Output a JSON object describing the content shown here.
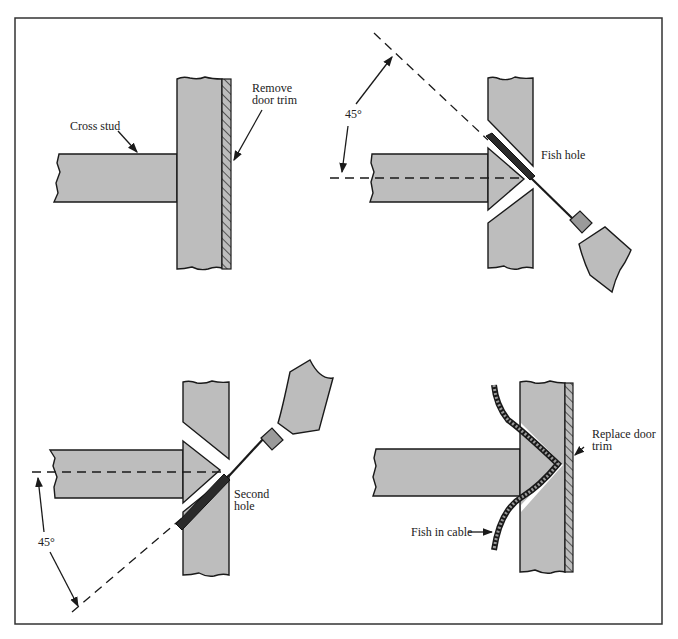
{
  "figure": {
    "colors": {
      "wood": "#bdbdbd",
      "line": "#1a1a1a",
      "background": "#ffffff"
    },
    "panels": [
      {
        "id": "step-1",
        "labels": {
          "cross_stud": "Cross stud",
          "trim_line1": "Remove",
          "trim_line2": "door trim"
        }
      },
      {
        "id": "step-2",
        "labels": {
          "angle": "45°",
          "hole": "Fish hole"
        }
      },
      {
        "id": "step-3",
        "labels": {
          "angle": "45°",
          "hole_line1": "Second",
          "hole_line2": "hole"
        }
      },
      {
        "id": "step-4",
        "labels": {
          "trim_line1": "Replace door",
          "trim_line2": "trim",
          "cable": "Fish in cable"
        }
      }
    ]
  }
}
